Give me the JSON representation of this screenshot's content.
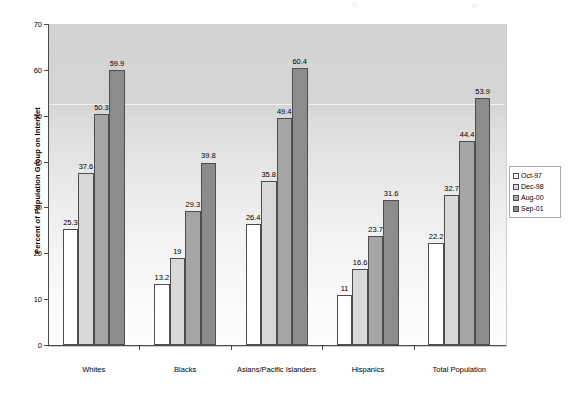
{
  "chart_data": {
    "type": "bar",
    "title": "",
    "subtitle": "",
    "xlabel": "",
    "ylabel": "Percent of Population Group on Internet",
    "ylim": [
      0,
      70
    ],
    "ytick_step": 10,
    "yticks": [
      "0",
      "10",
      "20",
      "30",
      "40",
      "50",
      "60",
      "70"
    ],
    "grid": false,
    "legend_position": "right",
    "categories": [
      "Whites",
      "Blacks",
      "Asians/Pacific Islanders",
      "Hispanics",
      "Total Population"
    ],
    "series": [
      {
        "name": "Oct-97",
        "color": "#ffffff",
        "values": [
          25.3,
          13.2,
          26.4,
          11,
          22.2
        ],
        "labels": [
          "25.3",
          "13.2",
          "26.4",
          "11",
          "22.2"
        ]
      },
      {
        "name": "Dec-98",
        "color": "#d9d9d9",
        "values": [
          37.6,
          19,
          35.8,
          16.6,
          32.7
        ],
        "labels": [
          "37.6",
          "19",
          "35.8",
          "16.6",
          "32.7"
        ]
      },
      {
        "name": "Aug-00",
        "color": "#a6a6a6",
        "values": [
          50.3,
          29.3,
          49.4,
          23.7,
          44.4
        ],
        "labels": [
          "50.3",
          "29.3",
          "49.4",
          "23.7",
          "44.4"
        ]
      },
      {
        "name": "Sep-01",
        "color": "#8c8c8c",
        "values": [
          59.9,
          39.8,
          60.4,
          31.6,
          53.9
        ],
        "labels": [
          "59.9",
          "39.8",
          "60.4",
          "31.6",
          "53.9"
        ]
      }
    ]
  },
  "legend": {
    "items": [
      {
        "label": "Oct-97",
        "color": "#ffffff"
      },
      {
        "label": "Dec-98",
        "color": "#d9d9d9"
      },
      {
        "label": "Aug-00",
        "color": "#a6a6a6"
      },
      {
        "label": "Sep-01",
        "color": "#8c8c8c"
      }
    ]
  },
  "axes": {
    "y_title": "Percent of Population Group on Internet"
  }
}
